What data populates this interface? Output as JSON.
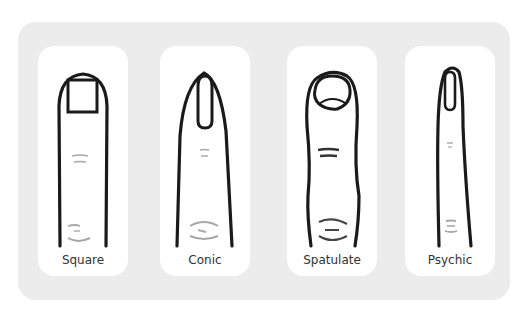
{
  "diagram": {
    "title_hidden": "",
    "finger_types": [
      {
        "id": "square",
        "label": "Square"
      },
      {
        "id": "conic",
        "label": "Conic"
      },
      {
        "id": "spatulate",
        "label": "Spatulate"
      },
      {
        "id": "psychic",
        "label": "Psychic"
      }
    ],
    "colors": {
      "panel": "#ececec",
      "card": "#ffffff",
      "outline": "#1a1a1a",
      "crease": "#a8a8a8"
    }
  }
}
